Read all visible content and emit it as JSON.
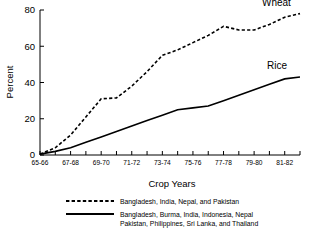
{
  "chart_data": {
    "type": "line",
    "title": "",
    "xlabel": "Crop Years",
    "ylabel": "Percent",
    "ylim": [
      0,
      80
    ],
    "yticks": [
      0,
      20,
      40,
      60,
      80
    ],
    "grid": false,
    "legend_position": "below-plot",
    "x": [
      "65-66",
      "66-67",
      "67-68",
      "68-69",
      "69-70",
      "70-71",
      "71-72",
      "72-73",
      "73-74",
      "74-75",
      "75-76",
      "76-77",
      "77-78",
      "78-79",
      "79-80",
      "80-81",
      "81-82",
      "82-83"
    ],
    "xtick_labels": [
      "65-66",
      "67-68",
      "69-70",
      "71-72",
      "73-74",
      "75-76",
      "77-78",
      "79-80",
      "81-82"
    ],
    "series": [
      {
        "name": "Wheat",
        "style": "dashed",
        "legend": "Bangladesh, India, Nepal, and Pakistan",
        "values": [
          0.5,
          4,
          11,
          21,
          31,
          31.5,
          38,
          46,
          55,
          58,
          62,
          66,
          71,
          69,
          69,
          72,
          76,
          78
        ]
      },
      {
        "name": "Rice",
        "style": "solid",
        "legend": "Bangladesh, Burma, India, Indonesia, Nepal Pakistan, Philippines, Sri Lanka, and Thailand",
        "values": [
          0.5,
          2,
          4,
          7,
          10,
          13,
          16,
          19,
          22,
          25,
          26,
          27,
          30,
          33,
          36,
          39,
          42,
          43
        ]
      }
    ],
    "annotations": [
      {
        "text": "Wheat",
        "x": "82-83",
        "y": 78
      },
      {
        "text": "Rice",
        "x": "82-83",
        "y": 43
      }
    ]
  },
  "legend": {
    "entries": [
      {
        "marker": "dashed-line",
        "label_lines": [
          "Bangladesh, India, Nepal, and Pakistan"
        ]
      },
      {
        "marker": "solid-line",
        "label_lines": [
          "Bangladesh, Burma, India, Indonesia, Nepal",
          "Pakistan, Philippines, Sri Lanka, and Thailand"
        ]
      }
    ]
  }
}
